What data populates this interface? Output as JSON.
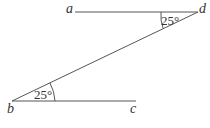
{
  "diagram": {
    "points": {
      "a": {
        "label": "a"
      },
      "b": {
        "label": "b"
      },
      "c": {
        "label": "c"
      },
      "d": {
        "label": "d"
      }
    },
    "angles": {
      "at_d": "25°",
      "at_b": "25°"
    },
    "segments": [
      "ad",
      "db",
      "bc"
    ]
  }
}
